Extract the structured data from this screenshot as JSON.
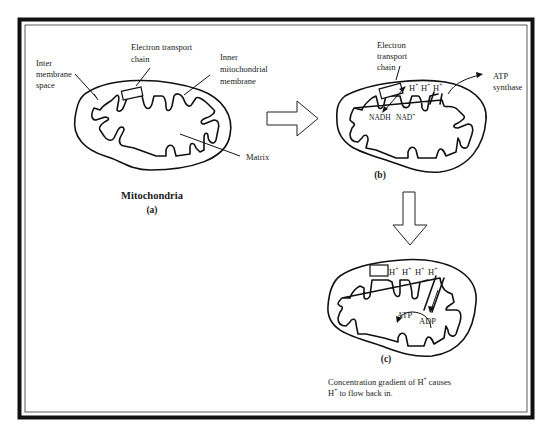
{
  "figure": {
    "panel_a": {
      "title": "Mitochondria",
      "caption": "(a)",
      "labels": {
        "inter_membrane_space": [
          "Inter",
          "membrane",
          "space"
        ],
        "electron_transport_chain": [
          "Electron transport",
          "chain"
        ],
        "inner_mitochondrial_membrane": [
          "Inner",
          "mitochondrial",
          "membrane"
        ],
        "matrix": "Matrix"
      }
    },
    "panel_b": {
      "caption": "(b)",
      "labels": {
        "electron_transport_chain": [
          "Electron",
          "transport",
          "chain"
        ],
        "atp_synthase": [
          "ATP",
          "synthase"
        ],
        "nadh": "NADH",
        "nad": "NAD",
        "nad_sup": "+",
        "protons": [
          "H",
          "H",
          "H"
        ],
        "proton_sup": "+"
      }
    },
    "panel_c": {
      "caption": "(c)",
      "labels": {
        "protons": [
          "H",
          "H",
          "H",
          "H"
        ],
        "proton_sup": "+",
        "atp": "ATP",
        "adp": "ADP"
      },
      "description": {
        "line1_prefix": "Concentration gradient of H",
        "line1_sup": "+",
        "line1_suffix": " causes",
        "line2_prefix": "H",
        "line2_sup": "+",
        "line2_suffix": " to flow back in."
      }
    },
    "arrows": {
      "a_to_b": "right-arrow",
      "b_to_c": "down-arrow"
    },
    "colors": {
      "frame": "#111111",
      "line": "#111111",
      "background": "#ffffff"
    }
  }
}
